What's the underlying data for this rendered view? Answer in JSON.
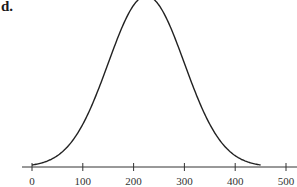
{
  "panel": {
    "label": "d."
  },
  "chart_data": {
    "type": "line",
    "title": "",
    "panel_label": "d.",
    "xlabel": "",
    "ylabel": "",
    "x_ticks": [
      0,
      100,
      200,
      300,
      400,
      500
    ],
    "xlim": [
      0,
      500
    ],
    "grid": false,
    "legend": null,
    "curve": {
      "shape": "normal distribution (bell curve)",
      "mean": 225,
      "std": 75,
      "x_start": 0,
      "x_end": 450
    },
    "y_axis_visible": false
  },
  "colors": {
    "curve": "#222222",
    "axis": "#333333",
    "background": "#ffffff"
  }
}
